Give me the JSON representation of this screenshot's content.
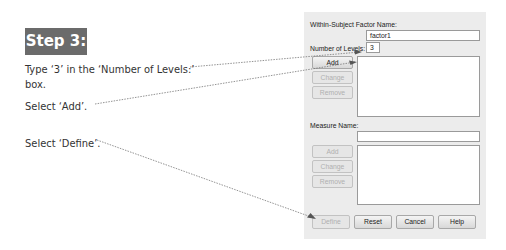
{
  "step": {
    "label": "Step 3:",
    "bg_color": "#6b6b6b"
  },
  "instructions": [
    {
      "text": "Type ‘3’ in the ‘Number of Levels:’ box."
    },
    {
      "text": "Select ‘Add’."
    },
    {
      "text": "Select ‘Define’."
    }
  ],
  "dialog": {
    "factor_name_label": "Within-Subject Factor Name:",
    "factor_name_value": "factor1",
    "levels_label": "Number of Levels:",
    "levels_value": "3",
    "factor_buttons": {
      "add": "Add",
      "change": "Change",
      "remove": "Remove"
    },
    "measure_name_label": "Measure Name:",
    "measure_name_value": "",
    "measure_buttons": {
      "add": "Add",
      "change": "Change",
      "remove": "Remove"
    },
    "footer_buttons": {
      "define": "Define",
      "reset": "Reset",
      "cancel": "Cancel",
      "help": "Help"
    }
  }
}
